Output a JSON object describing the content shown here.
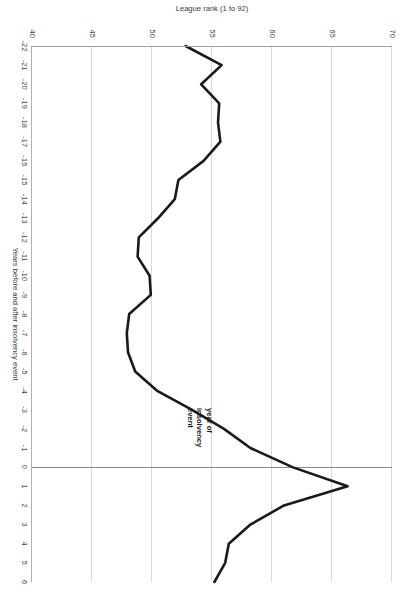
{
  "chart_data": {
    "type": "line",
    "title": "",
    "subtitle": "",
    "xlabel": "Years before and after insolvency event",
    "ylabel": "League rank (1 to 92)",
    "orientation": "page-rotated-90-clockwise",
    "grid": "value-axis gridlines only",
    "legend": "none",
    "xlim": [
      -22,
      6
    ],
    "ylim": [
      40,
      70
    ],
    "y_axis_inverted_on_page": true,
    "xticks": [
      -22,
      -21,
      -20,
      -19,
      -18,
      -17,
      -16,
      -15,
      -14,
      -13,
      -12,
      -11,
      -10,
      -9,
      -8,
      -7,
      -6,
      -5,
      -4,
      -3,
      -2,
      -1,
      0,
      1,
      2,
      3,
      4,
      5,
      6
    ],
    "xtick_labels": [
      "-22",
      "-21",
      "-20",
      "-19",
      "-18",
      "-17",
      "-16",
      "-15",
      "-14",
      "-13",
      "-12",
      "-11",
      "-10",
      "-9",
      "-8",
      "-7",
      "-6",
      "-5",
      "-4",
      "-3",
      "-2",
      "-1",
      "0",
      "1",
      "2",
      "3",
      "4",
      "5",
      "6"
    ],
    "yticks": [
      40,
      45,
      50,
      55,
      60,
      65,
      70
    ],
    "ytick_labels": [
      "40",
      "45",
      "50",
      "55",
      "60",
      "65",
      "70"
    ],
    "gridline_values": [
      45,
      50,
      55,
      60,
      65,
      70
    ],
    "series": [
      {
        "name": "League rank",
        "color": "#1a1a1a",
        "x": [
          -22,
          -21,
          -20,
          -19,
          -18,
          -17,
          -16,
          -15,
          -14,
          -13,
          -12,
          -11,
          -10,
          -9,
          -8,
          -7,
          -6,
          -5,
          -4,
          -3,
          -2,
          -1,
          0,
          1,
          2,
          3,
          4,
          5,
          6
        ],
        "values": [
          52.8,
          55.8,
          54.1,
          55.6,
          55.5,
          55.7,
          54.3,
          52.2,
          51.9,
          50.5,
          48.9,
          48.8,
          49.8,
          49.9,
          48.1,
          47.9,
          48.0,
          48.6,
          50.4,
          53.3,
          56.0,
          58.2,
          61.7,
          66.3,
          61.0,
          58.2,
          56.4,
          56.1,
          55.2
        ]
      }
    ],
    "annotations": [
      {
        "name": "year-of-insolvency-event",
        "lines": [
          "year of",
          "insolvency",
          "event"
        ],
        "target_x": 0
      }
    ],
    "reference_lines": [
      {
        "name": "zero-year-line",
        "axis": "x",
        "value": 0,
        "color": "#8a8a8a"
      }
    ],
    "colors": {
      "series": "#1a1a1a",
      "gridline": "#d9d9d9",
      "axis": "#9e9e9e",
      "text": "#3c3c3c",
      "background": "#ffffff"
    }
  }
}
